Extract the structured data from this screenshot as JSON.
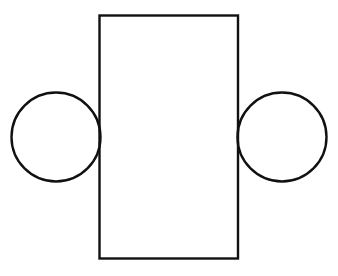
{
  "diagram": {
    "background_color": "#ffffff",
    "stroke_color": "#111111",
    "shapes": [
      {
        "id": "body-rectangle",
        "type": "rectangle",
        "role": "center"
      },
      {
        "id": "left-circle",
        "type": "circle",
        "role": "left",
        "attached_to": "body-rectangle"
      },
      {
        "id": "right-circle",
        "type": "circle",
        "role": "right",
        "attached_to": "body-rectangle"
      }
    ]
  }
}
